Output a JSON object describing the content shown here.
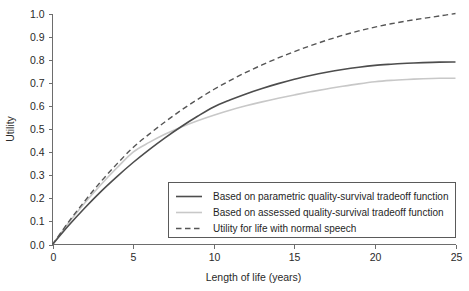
{
  "chart_data": {
    "type": "line",
    "title": "",
    "xlabel": "Length of life (years)",
    "ylabel": "Utility",
    "xlim": [
      0,
      25
    ],
    "ylim": [
      0.0,
      1.0
    ],
    "xticks": [
      0,
      5,
      10,
      15,
      20,
      25
    ],
    "xtick_labels": [
      "0",
      "5",
      "10",
      "15",
      "20",
      "25"
    ],
    "yticks": [
      0.0,
      0.1,
      0.2,
      0.3,
      0.4,
      0.5,
      0.6,
      0.7,
      0.8,
      0.9,
      1.0
    ],
    "ytick_labels": [
      "0.0",
      "0.1",
      "0.2",
      "0.3",
      "0.4",
      "0.5",
      "0.6",
      "0.7",
      "0.8",
      "0.9",
      "1.0"
    ],
    "grid": false,
    "legend_position": "lower-right-inside",
    "x": [
      0,
      1,
      2,
      3,
      4,
      5,
      6,
      7,
      8,
      9,
      10,
      11,
      12,
      13,
      14,
      15,
      16,
      17,
      18,
      19,
      20,
      21,
      22,
      23,
      24,
      25
    ],
    "series": [
      {
        "name": "Based on parametric quality-survival tradeoff function",
        "style": "solid",
        "color": "#4d4d4d",
        "width": 1.6,
        "values": [
          0.0,
          0.082,
          0.158,
          0.229,
          0.294,
          0.355,
          0.411,
          0.463,
          0.511,
          0.555,
          0.5955,
          0.6255,
          0.652,
          0.6755,
          0.6965,
          0.7155,
          0.7315,
          0.7455,
          0.7575,
          0.7675,
          0.7755,
          0.7805,
          0.7845,
          0.7875,
          0.7895,
          0.79
        ]
      },
      {
        "name": "Based on assessed quality-survival tradeoff function",
        "style": "solid",
        "color": "#c8c8c8",
        "width": 1.6,
        "values": [
          0.0,
          0.094,
          0.18,
          0.259,
          0.332,
          0.4,
          0.442,
          0.478,
          0.509,
          0.536,
          0.56,
          0.5815,
          0.6005,
          0.6175,
          0.633,
          0.6475,
          0.661,
          0.6735,
          0.685,
          0.6955,
          0.7045,
          0.7105,
          0.7145,
          0.7175,
          0.7195,
          0.72
        ]
      },
      {
        "name": "Utility for life with normal speech",
        "style": "dashed",
        "color": "#555555",
        "width": 1.4,
        "values": [
          0.0,
          0.098,
          0.188,
          0.272,
          0.349,
          0.42,
          0.478,
          0.532,
          0.582,
          0.628,
          0.671,
          0.7095,
          0.745,
          0.7775,
          0.8075,
          0.835,
          0.8605,
          0.884,
          0.9055,
          0.9245,
          0.941,
          0.9555,
          0.968,
          0.979,
          0.989,
          1.0
        ]
      }
    ]
  },
  "legend": {
    "entries": [
      {
        "label": "Based on parametric quality-survival tradeoff function"
      },
      {
        "label": "Based on assessed quality-survival tradeoff function"
      },
      {
        "label": "Utility for life with normal speech"
      }
    ]
  },
  "colors": {
    "axis": "#6d6d6d",
    "text": "#2a2a2a",
    "background": "#ffffff",
    "legend_border": "#5a5a5a"
  }
}
